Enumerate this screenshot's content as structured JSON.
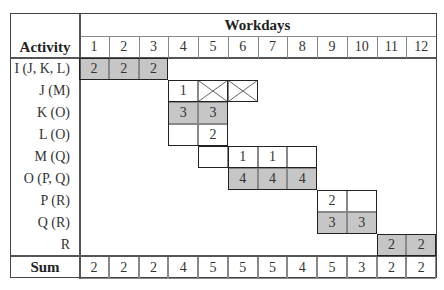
{
  "table": {
    "header": {
      "group_label": "Workdays",
      "activity_label": "Activity",
      "days": [
        "1",
        "2",
        "3",
        "4",
        "5",
        "6",
        "7",
        "8",
        "9",
        "10",
        "11",
        "12"
      ]
    },
    "rows": [
      {
        "activity": "I (J, K, L)",
        "cells": [
          {
            "day": 1,
            "value": "2",
            "shaded": true
          },
          {
            "day": 2,
            "value": "2",
            "shaded": true
          },
          {
            "day": 3,
            "value": "2",
            "shaded": true
          }
        ]
      },
      {
        "activity": "J (M)",
        "cells": [
          {
            "day": 4,
            "value": "1",
            "shaded": false
          },
          {
            "day": 5,
            "value": "",
            "crossed": true
          },
          {
            "day": 6,
            "value": "",
            "crossed": true
          }
        ]
      },
      {
        "activity": "K (O)",
        "cells": [
          {
            "day": 4,
            "value": "3",
            "shaded": true
          },
          {
            "day": 5,
            "value": "3",
            "shaded": true
          }
        ]
      },
      {
        "activity": "L (O)",
        "cells": [
          {
            "day": 4,
            "value": "",
            "shaded": false
          },
          {
            "day": 5,
            "value": "2",
            "shaded": false
          }
        ]
      },
      {
        "activity": "M (Q)",
        "cells": [
          {
            "day": 5,
            "value": "",
            "shaded": false
          },
          {
            "day": 6,
            "value": "1",
            "shaded": false
          },
          {
            "day": 7,
            "value": "1",
            "shaded": false
          },
          {
            "day": 8,
            "value": "",
            "shaded": false
          }
        ]
      },
      {
        "activity": "O (P, Q)",
        "cells": [
          {
            "day": 6,
            "value": "4",
            "shaded": true
          },
          {
            "day": 7,
            "value": "4",
            "shaded": true
          },
          {
            "day": 8,
            "value": "4",
            "shaded": true
          }
        ]
      },
      {
        "activity": "P (R)",
        "cells": [
          {
            "day": 9,
            "value": "2",
            "shaded": false
          },
          {
            "day": 10,
            "value": "",
            "shaded": false
          }
        ]
      },
      {
        "activity": "Q (R)",
        "cells": [
          {
            "day": 9,
            "value": "3",
            "shaded": true
          },
          {
            "day": 10,
            "value": "3",
            "shaded": true
          }
        ]
      },
      {
        "activity": "R",
        "cells": [
          {
            "day": 11,
            "value": "2",
            "shaded": true
          },
          {
            "day": 12,
            "value": "2",
            "shaded": true
          }
        ]
      }
    ],
    "sum": {
      "label": "Sum",
      "values": [
        "2",
        "2",
        "2",
        "4",
        "5",
        "5",
        "5",
        "4",
        "5",
        "3",
        "2",
        "2"
      ]
    },
    "colors": {
      "shaded": "#c6c6c6",
      "border": "#444444"
    }
  }
}
